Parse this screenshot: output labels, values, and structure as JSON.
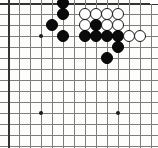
{
  "diagram": {
    "board_type": "go",
    "crop": "top-left corner region of a 19x19 board",
    "grid": {
      "columns_visible": 14,
      "rows_visible": 14,
      "origin_x": 8,
      "origin_y": 3,
      "spacing": 11,
      "line_color": "#7d7d7d",
      "edge_color": "#333333",
      "background_color": "#fdfdfb"
    },
    "stone_radius": 6,
    "colors": {
      "black_stone": "#0b0b0b",
      "white_stone": "#ffffff",
      "white_stone_border": "#1a1a1a",
      "star_point": "#1b1b1b"
    },
    "star_points": [
      {
        "col": 3,
        "row": 3
      },
      {
        "col": 3,
        "row": 10
      },
      {
        "col": 10,
        "row": 10
      }
    ],
    "stones": [
      {
        "color": "black",
        "col": 5,
        "row": 0
      },
      {
        "color": "black",
        "col": 5,
        "row": 1
      },
      {
        "color": "black",
        "col": 4,
        "row": 2
      },
      {
        "color": "black",
        "col": 5,
        "row": 3
      },
      {
        "color": "white",
        "col": 7,
        "row": 1
      },
      {
        "color": "white",
        "col": 8,
        "row": 1
      },
      {
        "color": "white",
        "col": 9,
        "row": 1
      },
      {
        "color": "white",
        "col": 10,
        "row": 1
      },
      {
        "color": "white",
        "col": 7,
        "row": 2
      },
      {
        "color": "black",
        "col": 8,
        "row": 2
      },
      {
        "color": "white",
        "col": 9,
        "row": 2
      },
      {
        "color": "white",
        "col": 10,
        "row": 2
      },
      {
        "color": "black",
        "col": 7,
        "row": 3
      },
      {
        "color": "black",
        "col": 8,
        "row": 3
      },
      {
        "color": "black",
        "col": 9,
        "row": 3
      },
      {
        "color": "black",
        "col": 10,
        "row": 3
      },
      {
        "color": "white",
        "col": 11,
        "row": 3
      },
      {
        "color": "white",
        "col": 12,
        "row": 3
      },
      {
        "color": "black",
        "col": 10,
        "row": 4
      },
      {
        "color": "black",
        "col": 9,
        "row": 5
      }
    ]
  }
}
